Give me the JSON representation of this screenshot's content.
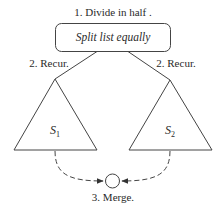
{
  "diagram": {
    "type": "divide-and-conquer",
    "step1_label": "1. Divide in half .",
    "box_label": "Split list equally",
    "recur_left_label": "2. Recur.",
    "recur_right_label": "2. Recur.",
    "left_set": {
      "name": "S",
      "subscript": "1"
    },
    "right_set": {
      "name": "S",
      "subscript": "2"
    },
    "merge_label": "3. Merge.",
    "colors": {
      "stroke": "#444444",
      "text": "#2a2a2a",
      "background": "#ffffff"
    }
  }
}
